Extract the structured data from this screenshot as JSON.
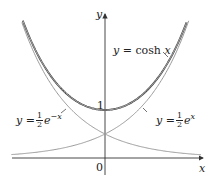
{
  "chart_data": {
    "type": "line",
    "title": "",
    "xlabel": "x",
    "ylabel": "y",
    "xlim": [
      -1.7,
      2.2
    ],
    "ylim": [
      -0.55,
      2.8
    ],
    "grid": false,
    "series": [
      {
        "name": "y = cosh x",
        "function": "cosh(x)",
        "color": "#333333"
      },
      {
        "name": "y = 1/2 e^x",
        "function": "0.5*exp(x)",
        "color": "#9a9a9a"
      },
      {
        "name": "y = 1/2 e^-x",
        "function": "0.5*exp(-x)",
        "color": "#9a9a9a"
      }
    ],
    "annotations": [
      "1",
      "0"
    ]
  },
  "labels": {
    "y_axis": "y",
    "x_axis": "x",
    "origin": "0",
    "one": "1",
    "cosh": {
      "prefix": "y = cosh ",
      "var": "x"
    },
    "exp_pos": {
      "prefix": "y = ",
      "num": "1",
      "den": "2",
      "base": "e",
      "exp": "x"
    },
    "exp_neg": {
      "prefix": "y = ",
      "num": "1",
      "den": "2",
      "base": "e",
      "exp": "−x"
    }
  },
  "colors": {
    "cosh": "#333333",
    "exp": "#9a9a9a",
    "axis": "#333333"
  }
}
